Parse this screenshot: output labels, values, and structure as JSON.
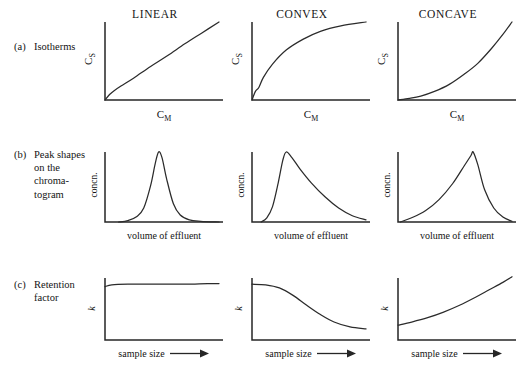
{
  "figure": {
    "caption_rows": [
      {
        "tag": "(a)",
        "text": "Isotherms"
      },
      {
        "tag": "(b)",
        "text": "Peak shapes\non the\nchroma-\ntogram"
      },
      {
        "tag": "(c)",
        "text": "Retention\nfactor"
      }
    ],
    "column_titles": [
      "LINEAR",
      "CONVEX",
      "CONCAVE"
    ],
    "axis_labels": {
      "isotherm_y": "Cs",
      "isotherm_y_base": "C",
      "isotherm_y_sub": "S",
      "isotherm_x_base": "C",
      "isotherm_x_sub": "M",
      "peak_y": "concn.",
      "peak_x": "volume of effluent",
      "retention_y": "k",
      "retention_x": "sample size",
      "retention_x_arrow": "⟶"
    },
    "colors": {
      "ink": "#262626",
      "curve": "#2b2b2b",
      "background": "#ffffff",
      "text": "#141414"
    }
  },
  "chart_data": {
    "type": "line",
    "grid": false,
    "legend": "none",
    "panel_grid": {
      "rows": 3,
      "columns": 3
    },
    "columns": [
      "LINEAR",
      "CONVEX",
      "CONCAVE"
    ],
    "rows": [
      {
        "id": "isotherms",
        "label": "(a) Isotherms",
        "xlabel": "C_M",
        "ylabel": "C_S",
        "xlim": [
          0,
          1
        ],
        "ylim": [
          0,
          1
        ],
        "series": [
          {
            "name": "LINEAR",
            "description": "straight line of constant slope through origin",
            "x": [
              0.0,
              0.04,
              0.08,
              0.14,
              0.25,
              0.4,
              0.55,
              0.7,
              0.85,
              1.0
            ],
            "y": [
              0.0,
              0.07,
              0.12,
              0.18,
              0.28,
              0.43,
              0.57,
              0.72,
              0.86,
              1.0
            ]
          },
          {
            "name": "CONVEX",
            "description": "steep initial rise then plateau (Langmuir type)",
            "x": [
              0.0,
              0.03,
              0.06,
              0.1,
              0.18,
              0.3,
              0.45,
              0.6,
              0.78,
              1.0
            ],
            "y": [
              0.0,
              0.11,
              0.16,
              0.29,
              0.46,
              0.64,
              0.78,
              0.88,
              0.95,
              1.0
            ]
          },
          {
            "name": "CONCAVE",
            "description": "slow initial rise then accelerating climb (anti-Langmuir type)",
            "x": [
              0.0,
              0.1,
              0.2,
              0.32,
              0.45,
              0.58,
              0.7,
              0.82,
              0.92,
              1.0
            ],
            "y": [
              0.0,
              0.02,
              0.05,
              0.11,
              0.2,
              0.33,
              0.47,
              0.66,
              0.84,
              1.0
            ]
          }
        ]
      },
      {
        "id": "peak-shapes",
        "label": "(b) Peak shapes on the chromatogram",
        "xlabel": "volume of effluent",
        "ylabel": "concn.",
        "xlim": [
          0,
          1
        ],
        "ylim": [
          0,
          1
        ],
        "series": [
          {
            "name": "LINEAR",
            "description": "symmetrical gaussian peak",
            "peak_position": 0.47,
            "x": [
              0.12,
              0.2,
              0.28,
              0.34,
              0.4,
              0.44,
              0.47,
              0.5,
              0.54,
              0.6,
              0.66,
              0.74,
              0.84,
              1.0
            ],
            "y": [
              0.0,
              0.02,
              0.08,
              0.2,
              0.52,
              0.83,
              1.0,
              0.92,
              0.62,
              0.26,
              0.1,
              0.03,
              0.01,
              0.0
            ]
          },
          {
            "name": "CONVEX",
            "description": "tailing peak: sharp front, long trailing edge",
            "peak_position": 0.3,
            "x": [
              0.08,
              0.13,
              0.18,
              0.23,
              0.27,
              0.3,
              0.35,
              0.42,
              0.52,
              0.64,
              0.76,
              0.88,
              1.0
            ],
            "y": [
              0.0,
              0.06,
              0.22,
              0.56,
              0.88,
              1.0,
              0.92,
              0.76,
              0.56,
              0.36,
              0.2,
              0.09,
              0.03
            ]
          },
          {
            "name": "CONCAVE",
            "description": "fronting peak: gradual rise, sharp rear edge",
            "peak_position": 0.66,
            "x": [
              0.02,
              0.12,
              0.24,
              0.36,
              0.48,
              0.58,
              0.64,
              0.66,
              0.7,
              0.76,
              0.84,
              0.92,
              1.0
            ],
            "y": [
              0.0,
              0.06,
              0.16,
              0.32,
              0.55,
              0.8,
              0.95,
              1.0,
              0.82,
              0.46,
              0.2,
              0.07,
              0.01
            ]
          }
        ]
      },
      {
        "id": "retention-factor",
        "label": "(c) Retention factor",
        "xlabel": "sample size",
        "ylabel": "k",
        "xlim": [
          0,
          1
        ],
        "ylim": [
          0,
          1
        ],
        "series": [
          {
            "name": "LINEAR",
            "description": "k independent of sample size (flat line)",
            "x": [
              0.0,
              0.06,
              0.2,
              0.45,
              0.7,
              0.9,
              1.0
            ],
            "y": [
              0.86,
              0.89,
              0.9,
              0.9,
              0.9,
              0.91,
              0.91
            ]
          },
          {
            "name": "CONVEX",
            "description": "k decreases as sample size increases",
            "x": [
              0.0,
              0.12,
              0.24,
              0.36,
              0.48,
              0.6,
              0.72,
              0.86,
              1.0
            ],
            "y": [
              0.9,
              0.89,
              0.84,
              0.72,
              0.56,
              0.41,
              0.29,
              0.21,
              0.18
            ]
          },
          {
            "name": "CONCAVE",
            "description": "k increases as sample size increases",
            "x": [
              0.0,
              0.12,
              0.26,
              0.4,
              0.54,
              0.68,
              0.8,
              0.92,
              1.0
            ],
            "y": [
              0.24,
              0.29,
              0.36,
              0.45,
              0.56,
              0.69,
              0.81,
              0.93,
              1.02
            ]
          }
        ]
      }
    ]
  }
}
